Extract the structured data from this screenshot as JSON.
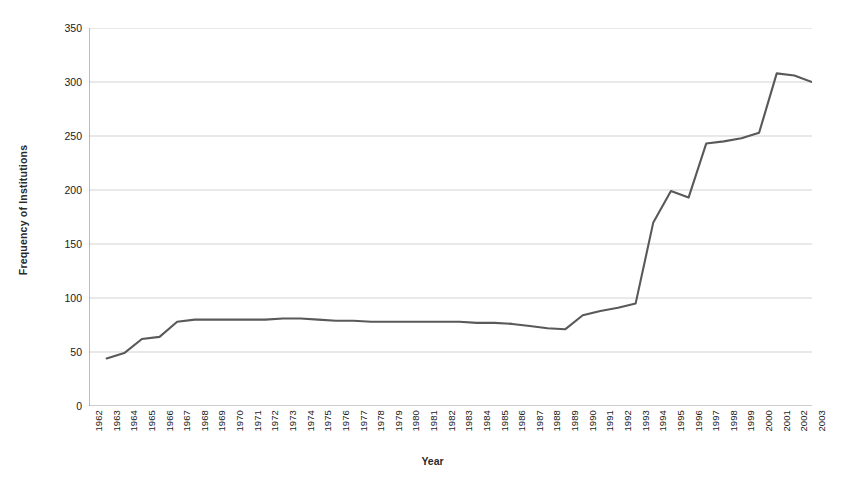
{
  "chart_data": {
    "type": "line",
    "title": "",
    "xlabel": "Year",
    "ylabel": "Frequency of Institutions",
    "xlim": [
      1962,
      2003
    ],
    "ylim": [
      0,
      350
    ],
    "yticks": [
      0,
      50,
      100,
      150,
      200,
      250,
      300,
      350
    ],
    "grid": true,
    "legend": "none",
    "line_color": "#595959",
    "categories": [
      "1962",
      "1963",
      "1964",
      "1965",
      "1966",
      "1967",
      "1968",
      "1969",
      "1970",
      "1971",
      "1972",
      "1973",
      "1974",
      "1975",
      "1976",
      "1977",
      "1978",
      "1979",
      "1980",
      "1981",
      "1982",
      "1983",
      "1984",
      "1985",
      "1986",
      "1987",
      "1988",
      "1989",
      "1990",
      "1991",
      "1992",
      "1993",
      "1994",
      "1995",
      "1996",
      "1997",
      "1998",
      "1999",
      "2000",
      "2001",
      "2002",
      "2003"
    ],
    "x": [
      1962,
      1963,
      1964,
      1965,
      1966,
      1967,
      1968,
      1969,
      1970,
      1971,
      1972,
      1973,
      1974,
      1975,
      1976,
      1977,
      1978,
      1979,
      1980,
      1981,
      1982,
      1983,
      1984,
      1985,
      1986,
      1987,
      1988,
      1989,
      1990,
      1991,
      1992,
      1993,
      1994,
      1995,
      1996,
      1997,
      1998,
      1999,
      2000,
      2001,
      2002,
      2003
    ],
    "values": [
      null,
      44,
      49,
      62,
      64,
      78,
      80,
      80,
      80,
      80,
      80,
      81,
      81,
      80,
      79,
      79,
      78,
      78,
      78,
      78,
      78,
      78,
      77,
      77,
      76,
      74,
      72,
      71,
      84,
      88,
      91,
      95,
      170,
      199,
      193,
      243,
      245,
      248,
      253,
      308,
      306,
      300
    ],
    "series": [
      {
        "name": "Frequency of Institutions",
        "values": [
          null,
          44,
          49,
          62,
          64,
          78,
          80,
          80,
          80,
          80,
          80,
          81,
          81,
          80,
          79,
          79,
          78,
          78,
          78,
          78,
          78,
          78,
          77,
          77,
          76,
          74,
          72,
          71,
          84,
          88,
          91,
          95,
          170,
          199,
          193,
          243,
          245,
          248,
          253,
          308,
          306,
          300
        ]
      }
    ]
  },
  "axes": {
    "y_title": "Frequency of Institutions",
    "x_title": "Year"
  }
}
